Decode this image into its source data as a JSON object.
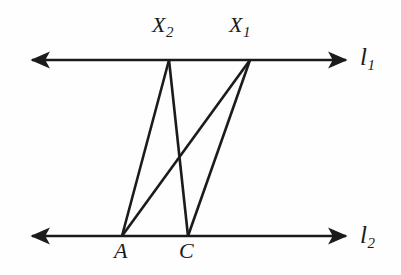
{
  "figure": {
    "background_color": "#fefefe",
    "stroke_color": "#1b1b1b",
    "stroke_width": 2.6,
    "labels": {
      "x2": {
        "base": "X",
        "sub": "2"
      },
      "x1": {
        "base": "X",
        "sub": "1"
      },
      "l1": {
        "base": "l",
        "sub": "1"
      },
      "l2": {
        "base": "l",
        "sub": "2"
      },
      "a": {
        "base": "A",
        "sub": ""
      },
      "c": {
        "base": "C",
        "sub": ""
      }
    },
    "points": {
      "X2": {
        "x": 169,
        "y": 60
      },
      "X1": {
        "x": 250,
        "y": 60
      },
      "A": {
        "x": 122,
        "y": 236
      },
      "C": {
        "x": 188,
        "y": 236
      }
    },
    "lines": {
      "l1": {
        "y": 60,
        "x_start": 28,
        "x_end": 350,
        "arrow_left": true,
        "arrow_right": true
      },
      "l2": {
        "y": 236,
        "x_start": 28,
        "x_end": 350,
        "arrow_left": true,
        "arrow_right": true
      }
    },
    "segments": [
      {
        "name": "A-X2",
        "from": "A",
        "to": "X2"
      },
      {
        "name": "A-X1",
        "from": "A",
        "to": "X1"
      },
      {
        "name": "C-X2",
        "from": "C",
        "to": "X2"
      },
      {
        "name": "C-X1",
        "from": "C",
        "to": "X1"
      }
    ]
  }
}
